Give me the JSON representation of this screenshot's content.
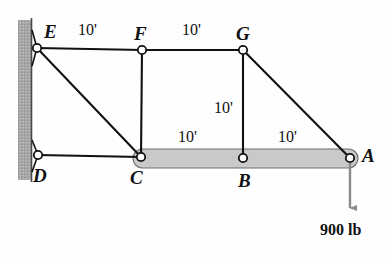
{
  "figure": {
    "type": "truss-diagram",
    "background_color": "#fefefe",
    "line_color": "#111111",
    "wall_fill": "#a8a8a8",
    "chord_fill": "#c9c9c9"
  },
  "nodes": [
    {
      "id": "E",
      "label": "E",
      "x": 37,
      "y": 48,
      "label_x": 44,
      "label_y": 22,
      "support": "pin-wall"
    },
    {
      "id": "F",
      "label": "F",
      "x": 142,
      "y": 50,
      "label_x": 134,
      "label_y": 24,
      "support": "none"
    },
    {
      "id": "G",
      "label": "G",
      "x": 243,
      "y": 50,
      "label_x": 236,
      "label_y": 24,
      "support": "none"
    },
    {
      "id": "D",
      "label": "D",
      "x": 38,
      "y": 155,
      "label_x": 33,
      "label_y": 166,
      "support": "pin-wall"
    },
    {
      "id": "C",
      "label": "C",
      "x": 141,
      "y": 157,
      "label_x": 130,
      "label_y": 168,
      "support": "none"
    },
    {
      "id": "B",
      "label": "B",
      "x": 243,
      "y": 158,
      "label_x": 238,
      "label_y": 171,
      "support": "none"
    },
    {
      "id": "A",
      "label": "A",
      "x": 350,
      "y": 158,
      "label_x": 362,
      "label_y": 146,
      "support": "none"
    }
  ],
  "members": [
    {
      "from": "E",
      "to": "F",
      "style": "line"
    },
    {
      "from": "F",
      "to": "G",
      "style": "line"
    },
    {
      "from": "E",
      "to": "C",
      "style": "line"
    },
    {
      "from": "F",
      "to": "C",
      "style": "line"
    },
    {
      "from": "G",
      "to": "B",
      "style": "line"
    },
    {
      "from": "G",
      "to": "A",
      "style": "line"
    },
    {
      "from": "D",
      "to": "C",
      "style": "line"
    },
    {
      "from": "C",
      "to": "A",
      "style": "thick-bar"
    }
  ],
  "dimensions": [
    {
      "id": "EF",
      "text": "10'",
      "x": 78,
      "y": 22,
      "between": "E-F"
    },
    {
      "id": "FG",
      "text": "10'",
      "x": 182,
      "y": 22,
      "between": "F-G"
    },
    {
      "id": "GB",
      "text": "10'",
      "x": 214,
      "y": 100,
      "between": "G-B"
    },
    {
      "id": "CB",
      "text": "10'",
      "x": 178,
      "y": 129,
      "between": "C-B"
    },
    {
      "id": "BA",
      "text": "10'",
      "x": 278,
      "y": 129,
      "between": "B-A"
    }
  ],
  "load": {
    "label": "900 lb",
    "magnitude": 900,
    "unit": "lb",
    "direction": "down",
    "applied_at": "A",
    "arrow_from_x": 350,
    "arrow_from_y": 163,
    "arrow_to_y": 215,
    "label_x": 320,
    "label_y": 222
  },
  "wall": {
    "x": 18,
    "y": 20,
    "width": 13,
    "height": 160,
    "edge_line_x": 31
  },
  "supports": [
    {
      "at": "E",
      "type": "pin",
      "apex_x": 37,
      "apex_y": 48,
      "wall_top_y": 30,
      "wall_bottom_y": 66
    },
    {
      "at": "D",
      "type": "pin",
      "apex_x": 38,
      "apex_y": 155,
      "wall_top_y": 140,
      "wall_bottom_y": 172
    }
  ]
}
